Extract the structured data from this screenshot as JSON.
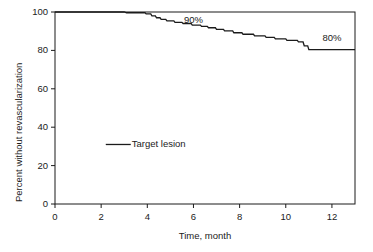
{
  "chart_data": {
    "type": "line",
    "subtype": "kaplan-meier-step",
    "title": "",
    "xlabel": "Time, month",
    "ylabel": "Percent without revascularization",
    "xlim": [
      0,
      13
    ],
    "ylim": [
      0,
      100
    ],
    "xticks": [
      0,
      2,
      4,
      6,
      8,
      10,
      12
    ],
    "xtick_labels": [
      "0",
      "2",
      "4",
      "6",
      "8",
      "10",
      "12"
    ],
    "yticks": [
      0,
      20,
      40,
      60,
      80,
      100
    ],
    "ytick_labels": [
      "0",
      "20",
      "40",
      "60",
      "80",
      "100"
    ],
    "grid": false,
    "frame": "box",
    "legend_position": "inside-left-middle",
    "series": [
      {
        "name": "Target lesion",
        "color": "#1b1b1b",
        "step_points": [
          [
            0.0,
            100.0
          ],
          [
            3.0,
            100.0
          ],
          [
            3.1,
            99.6
          ],
          [
            3.9,
            99.6
          ],
          [
            3.95,
            99.0
          ],
          [
            4.15,
            99.0
          ],
          [
            4.2,
            98.0
          ],
          [
            4.35,
            98.0
          ],
          [
            4.4,
            97.0
          ],
          [
            4.55,
            97.0
          ],
          [
            4.6,
            96.2
          ],
          [
            4.8,
            96.2
          ],
          [
            4.85,
            95.4
          ],
          [
            5.15,
            95.4
          ],
          [
            5.2,
            94.6
          ],
          [
            5.5,
            94.6
          ],
          [
            5.55,
            94.0
          ],
          [
            5.9,
            94.0
          ],
          [
            5.95,
            93.2
          ],
          [
            6.3,
            93.2
          ],
          [
            6.35,
            92.5
          ],
          [
            6.6,
            92.5
          ],
          [
            6.65,
            91.8
          ],
          [
            6.95,
            91.8
          ],
          [
            7.0,
            91.0
          ],
          [
            7.3,
            91.0
          ],
          [
            7.35,
            90.2
          ],
          [
            7.7,
            90.2
          ],
          [
            7.75,
            89.2
          ],
          [
            8.1,
            89.2
          ],
          [
            8.15,
            88.4
          ],
          [
            8.6,
            88.4
          ],
          [
            8.65,
            87.6
          ],
          [
            9.1,
            87.6
          ],
          [
            9.15,
            86.8
          ],
          [
            9.5,
            86.8
          ],
          [
            9.55,
            86.0
          ],
          [
            10.0,
            86.0
          ],
          [
            10.05,
            85.2
          ],
          [
            10.5,
            85.2
          ],
          [
            10.55,
            84.4
          ],
          [
            10.75,
            84.4
          ],
          [
            10.8,
            82.4
          ],
          [
            10.95,
            82.4
          ],
          [
            11.0,
            80.4
          ],
          [
            13.0,
            80.4
          ]
        ]
      }
    ],
    "annotations": [
      {
        "text": "90%",
        "x": 6.0,
        "y": 96.0,
        "name": "annotation-90-percent"
      },
      {
        "text": "80%",
        "x": 12.0,
        "y": 86.5,
        "name": "annotation-80-percent"
      }
    ],
    "legend": {
      "label": "Target lesion",
      "x": 2.2,
      "y": 31.0
    }
  }
}
